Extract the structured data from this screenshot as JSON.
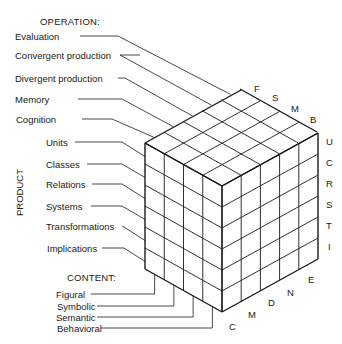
{
  "operation": {
    "header": "OPERATION:",
    "items": [
      "Evaluation",
      "Convergent production",
      "Divergent production",
      "Memory",
      "Cognition"
    ],
    "codes": [
      "E",
      "N",
      "D",
      "M",
      "C"
    ]
  },
  "product": {
    "header": "PRODUCT",
    "items": [
      "Units",
      "Classes",
      "Relations",
      "Systems",
      "Transformations",
      "Implications"
    ],
    "codes": [
      "U",
      "C",
      "R",
      "S",
      "T",
      "I"
    ]
  },
  "content": {
    "header": "CONTENT:",
    "items": [
      "Figural",
      "Symbolic",
      "Semantic",
      "Behavioral"
    ],
    "codes": [
      "F",
      "S",
      "M",
      "B"
    ]
  },
  "colors": {
    "line": "#1a1a1a",
    "background": "#ffffff"
  }
}
